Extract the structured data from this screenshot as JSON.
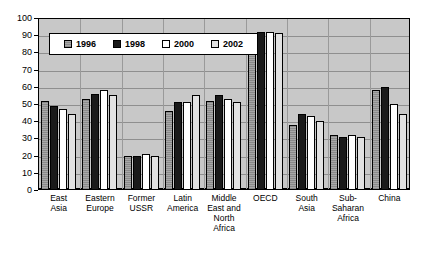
{
  "chart_data": {
    "type": "bar",
    "title": "",
    "xlabel": "",
    "ylabel": "",
    "ylim": [
      0,
      100
    ],
    "ytick_step": 10,
    "grid": true,
    "legend_position": "top-left-inside",
    "categories": [
      "East\nAsia",
      "Eastern\nEurope",
      "Former\nUSSR",
      "Latin\nAmerica",
      "Middle\nEast and\nNorth\nAfrica",
      "OECD",
      "South\nAsia",
      "Sub-\nSaharan\nAfrica",
      "China"
    ],
    "ytick_labels": [
      "100",
      "90",
      "80",
      "70",
      "60",
      "50",
      "40",
      "30",
      "20",
      "10",
      "0"
    ],
    "series": [
      {
        "name": "1996",
        "color": "#9a9a9a",
        "values": [
          52,
          53,
          20,
          46,
          52,
          91,
          38,
          32,
          58
        ]
      },
      {
        "name": "1998",
        "color": "#1a1a1a",
        "values": [
          49,
          56,
          20,
          51,
          55,
          92,
          44,
          31,
          60
        ]
      },
      {
        "name": "2000",
        "color": "#ffffff",
        "values": [
          47,
          58,
          21,
          51,
          53,
          92,
          43,
          32,
          50
        ]
      },
      {
        "name": "2002",
        "color": "#e2e2e2",
        "values": [
          44,
          55,
          20,
          55,
          51,
          91,
          40,
          31,
          44
        ]
      }
    ]
  },
  "plot": {
    "background_color": "#c8c8c8",
    "gridline_color": "#8f8f8f",
    "border_color": "#000000"
  }
}
